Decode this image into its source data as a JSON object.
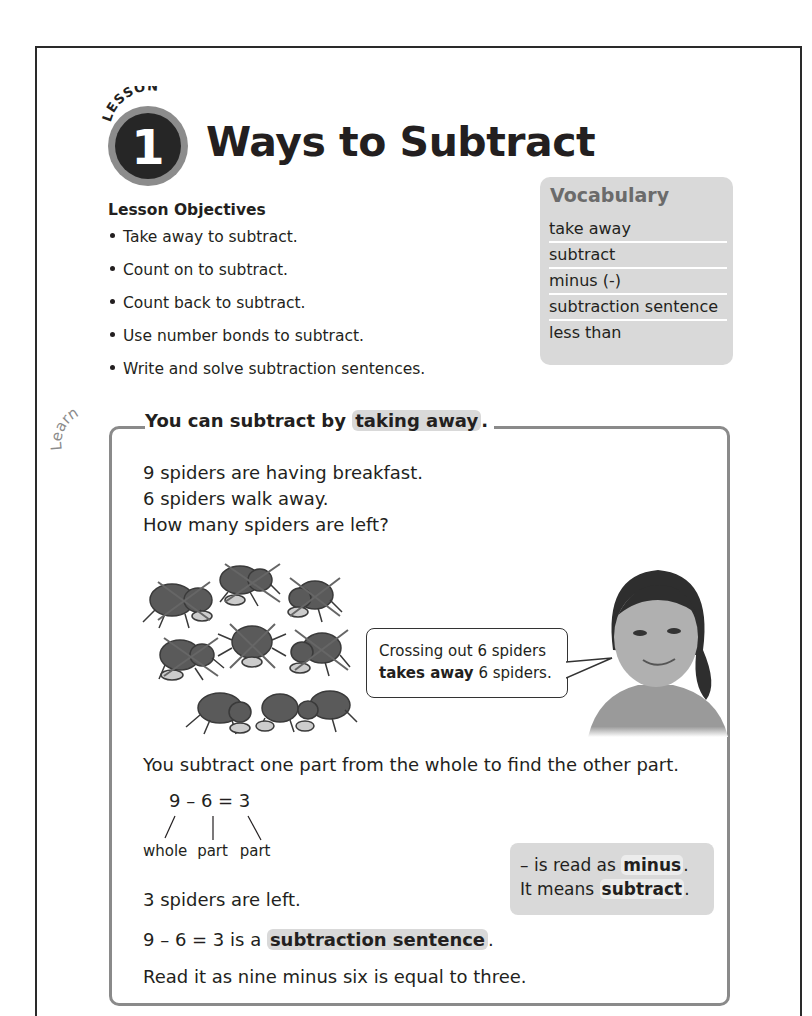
{
  "lesson": {
    "badge_word": "LESSON",
    "number": "1",
    "title": "Ways to Subtract"
  },
  "objectives": {
    "heading": "Lesson Objectives",
    "items": [
      "Take away to subtract.",
      "Count on to subtract.",
      "Count back to subtract.",
      "Use number bonds to subtract.",
      "Write and solve subtraction sentences."
    ]
  },
  "vocabulary": {
    "title": "Vocabulary",
    "items": [
      "take away",
      "subtract",
      "minus (-)",
      "subtraction sentence",
      "less than"
    ]
  },
  "learn": {
    "label": "Learn",
    "heading_prefix": "You can subtract by ",
    "heading_highlight": "taking away",
    "heading_suffix": ".",
    "story": [
      "9 spiders are having breakfast.",
      "6 spiders walk away.",
      "How many spiders are left?"
    ],
    "bubble_line1": "Crossing out 6 spiders",
    "bubble_bold": "takes away",
    "bubble_line2_rest": " 6 spiders.",
    "whole_part_text": "You subtract one part from the whole to find the other part.",
    "equation": "9 – 6 = 3",
    "labels": [
      "whole",
      "part",
      "part"
    ],
    "answer": "3 spiders are left.",
    "sentence_prefix": "9 – 6 = 3 is a ",
    "sentence_highlight": "subtraction sentence",
    "sentence_suffix": ".",
    "read_as": "Read it as nine minus six is equal to three.",
    "note_line1_prefix": "– is read as ",
    "note_line1_bold": "minus",
    "note_line1_suffix": ".",
    "note_line2_prefix": "It means ",
    "note_line2_bold": "subtract",
    "note_line2_suffix": "."
  },
  "colors": {
    "highlight_gray": "#d9d9d9",
    "box_border": "#8a8a8a",
    "text": "#231f20"
  }
}
